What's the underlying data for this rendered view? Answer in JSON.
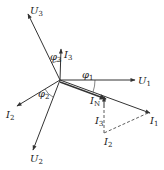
{
  "diagram": {
    "color": "#333333",
    "phasors": [
      {
        "name": "U1",
        "label": "U",
        "sub": "1",
        "angle_deg": 0,
        "magnitude": 1.0
      },
      {
        "name": "U2",
        "label": "U",
        "sub": "2",
        "angle_deg": -113,
        "magnitude": 1.0
      },
      {
        "name": "U3",
        "label": "U",
        "sub": "3",
        "angle_deg": 116,
        "magnitude": 1.0
      },
      {
        "name": "I1",
        "label": "I",
        "sub": "1",
        "angle_deg": -19,
        "magnitude": 1.2
      },
      {
        "name": "I2",
        "label": "I",
        "sub": "2",
        "angle_deg": -155,
        "magnitude": 0.57
      },
      {
        "name": "I3",
        "label": "I",
        "sub": "3",
        "angle_deg": 75,
        "magnitude": 0.41
      },
      {
        "name": "IN",
        "label": "I",
        "sub": "N",
        "angle_deg": -19,
        "magnitude": 0.6
      }
    ],
    "angles": [
      {
        "name": "phi1",
        "label": "φ",
        "sub": "1"
      },
      {
        "name": "phi2",
        "label": "φ",
        "sub": "2"
      },
      {
        "name": "phi3",
        "label": "φ",
        "sub": "3"
      }
    ],
    "construction_labels": [
      {
        "name": "I3-prime",
        "label": "I",
        "sub": "3"
      },
      {
        "name": "I2-prime",
        "label": "I",
        "sub": "2"
      }
    ]
  }
}
